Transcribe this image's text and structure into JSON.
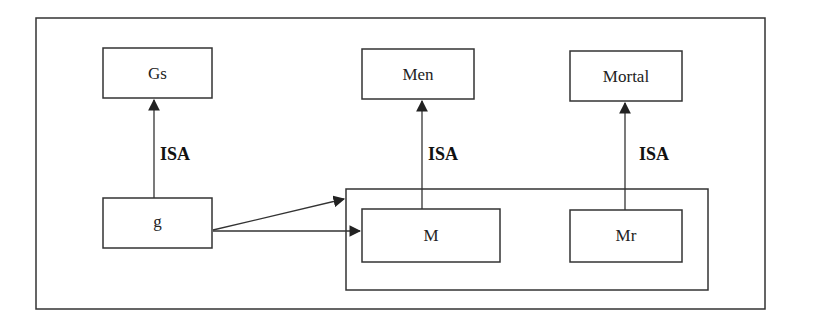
{
  "diagram": {
    "nodes": {
      "gs": {
        "label": "Gs"
      },
      "men": {
        "label": "Men"
      },
      "mortal": {
        "label": "Mortal"
      },
      "g": {
        "label": "g"
      },
      "m": {
        "label": "M"
      },
      "mr": {
        "label": "Mr"
      }
    },
    "edges": [
      {
        "from": "g",
        "to": "gs",
        "label": "ISA"
      },
      {
        "from": "m",
        "to": "men",
        "label": "ISA"
      },
      {
        "from": "mr",
        "to": "mortal",
        "label": "ISA"
      },
      {
        "from": "g",
        "to": "m-mr-group",
        "label": ""
      },
      {
        "from": "g",
        "to": "m",
        "label": ""
      }
    ],
    "edge_labels": {
      "g_gs": "ISA",
      "m_men": "ISA",
      "mr_mortal": "ISA"
    },
    "colors": {
      "stroke": "#333333",
      "background": "#ffffff"
    }
  }
}
